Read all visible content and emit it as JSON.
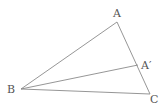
{
  "diagram": {
    "type": "triangle-with-cevian",
    "points": {
      "A": {
        "label": "A",
        "x": 117,
        "y": 22
      },
      "B": {
        "label": "B",
        "x": 21,
        "y": 89
      },
      "C": {
        "label": "C",
        "x": 150,
        "y": 94
      },
      "A_prime": {
        "label": "A′",
        "x": 138,
        "y": 65
      }
    },
    "segments": [
      {
        "from": "A",
        "to": "B"
      },
      {
        "from": "A",
        "to": "C"
      },
      {
        "from": "B",
        "to": "C"
      },
      {
        "from": "B",
        "to": "A_prime"
      }
    ],
    "colors": {
      "stroke": "#8a8a8a",
      "label": "#555555"
    }
  }
}
